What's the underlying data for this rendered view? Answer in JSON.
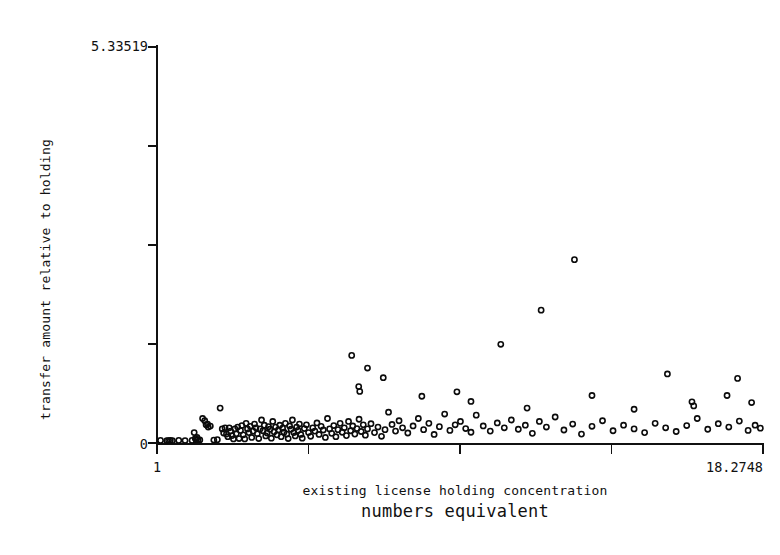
{
  "chart_data": {
    "type": "scatter",
    "title": "",
    "xlabel": "existing license holding concentration",
    "xlabel_line2": "numbers equivalent",
    "ylabel": "transfer amount relative to holding",
    "xlim": [
      1,
      18.2748
    ],
    "ylim": [
      0,
      5.33519
    ],
    "xticks": [
      1,
      5.3187,
      9.6374,
      13.9561,
      18.2748
    ],
    "xtick_labels": [
      "1",
      "",
      "",
      "",
      "18.2748"
    ],
    "yticks": [
      0,
      1.333798,
      2.667595,
      4.001393,
      5.33519
    ],
    "ytick_labels": [
      "0",
      "",
      "",
      "",
      "5.33519"
    ],
    "grid": false,
    "legend": null,
    "marker": "open-circle",
    "marker_color": "#0b0b0b",
    "n_points": 174,
    "points": [
      [
        1.1,
        0.035
      ],
      [
        1.28,
        0.03
      ],
      [
        1.33,
        0.032
      ],
      [
        1.38,
        0.035
      ],
      [
        1.44,
        0.03
      ],
      [
        1.62,
        0.035
      ],
      [
        1.8,
        0.033
      ],
      [
        2.0,
        0.035
      ],
      [
        2.06,
        0.14
      ],
      [
        2.09,
        0.06
      ],
      [
        2.12,
        0.04
      ],
      [
        2.14,
        0.075
      ],
      [
        2.17,
        0.045
      ],
      [
        2.22,
        0.042
      ],
      [
        2.3,
        0.33
      ],
      [
        2.36,
        0.3
      ],
      [
        2.4,
        0.245
      ],
      [
        2.44,
        0.255
      ],
      [
        2.46,
        0.215
      ],
      [
        2.52,
        0.228
      ],
      [
        2.62,
        0.04
      ],
      [
        2.72,
        0.045
      ],
      [
        2.8,
        0.47
      ],
      [
        2.86,
        0.19
      ],
      [
        2.9,
        0.135
      ],
      [
        2.94,
        0.205
      ],
      [
        2.98,
        0.12
      ],
      [
        3.02,
        0.085
      ],
      [
        3.06,
        0.205
      ],
      [
        3.1,
        0.16
      ],
      [
        3.14,
        0.1
      ],
      [
        3.18,
        0.055
      ],
      [
        3.22,
        0.19
      ],
      [
        3.26,
        0.125
      ],
      [
        3.3,
        0.215
      ],
      [
        3.34,
        0.06
      ],
      [
        3.38,
        0.17
      ],
      [
        3.42,
        0.235
      ],
      [
        3.46,
        0.11
      ],
      [
        3.5,
        0.055
      ],
      [
        3.54,
        0.265
      ],
      [
        3.58,
        0.19
      ],
      [
        3.62,
        0.14
      ],
      [
        3.66,
        0.225
      ],
      [
        3.7,
        0.075
      ],
      [
        3.74,
        0.16
      ],
      [
        3.78,
        0.255
      ],
      [
        3.82,
        0.205
      ],
      [
        3.86,
        0.125
      ],
      [
        3.9,
        0.06
      ],
      [
        3.94,
        0.19
      ],
      [
        3.98,
        0.31
      ],
      [
        4.02,
        0.165
      ],
      [
        4.06,
        0.24
      ],
      [
        4.1,
        0.095
      ],
      [
        4.14,
        0.135
      ],
      [
        4.18,
        0.22
      ],
      [
        4.22,
        0.185
      ],
      [
        4.26,
        0.065
      ],
      [
        4.3,
        0.29
      ],
      [
        4.34,
        0.15
      ],
      [
        4.38,
        0.215
      ],
      [
        4.42,
        0.11
      ],
      [
        4.46,
        0.175
      ],
      [
        4.5,
        0.24
      ],
      [
        4.54,
        0.085
      ],
      [
        4.58,
        0.2
      ],
      [
        4.62,
        0.145
      ],
      [
        4.66,
        0.265
      ],
      [
        4.7,
        0.12
      ],
      [
        4.74,
        0.06
      ],
      [
        4.78,
        0.23
      ],
      [
        4.82,
        0.185
      ],
      [
        4.86,
        0.31
      ],
      [
        4.9,
        0.14
      ],
      [
        4.94,
        0.095
      ],
      [
        4.98,
        0.215
      ],
      [
        5.02,
        0.17
      ],
      [
        5.06,
        0.255
      ],
      [
        5.1,
        0.115
      ],
      [
        5.14,
        0.065
      ],
      [
        5.2,
        0.195
      ],
      [
        5.26,
        0.245
      ],
      [
        5.32,
        0.14
      ],
      [
        5.38,
        0.09
      ],
      [
        5.44,
        0.205
      ],
      [
        5.5,
        0.16
      ],
      [
        5.56,
        0.27
      ],
      [
        5.62,
        0.115
      ],
      [
        5.68,
        0.225
      ],
      [
        5.74,
        0.175
      ],
      [
        5.8,
        0.075
      ],
      [
        5.86,
        0.33
      ],
      [
        5.92,
        0.19
      ],
      [
        5.98,
        0.13
      ],
      [
        6.04,
        0.235
      ],
      [
        6.1,
        0.085
      ],
      [
        6.16,
        0.18
      ],
      [
        6.22,
        0.265
      ],
      [
        6.28,
        0.145
      ],
      [
        6.34,
        0.205
      ],
      [
        6.4,
        0.1
      ],
      [
        6.46,
        0.29
      ],
      [
        6.52,
        0.165
      ],
      [
        6.58,
        0.23
      ],
      [
        6.64,
        0.12
      ],
      [
        6.7,
        0.195
      ],
      [
        6.76,
        0.32
      ],
      [
        6.82,
        0.155
      ],
      [
        6.88,
        0.245
      ],
      [
        6.94,
        0.105
      ],
      [
        7.0,
        0.19
      ],
      [
        7.1,
        0.26
      ],
      [
        7.2,
        0.14
      ],
      [
        7.3,
        0.215
      ],
      [
        7.4,
        0.09
      ],
      [
        7.5,
        0.18
      ],
      [
        7.6,
        0.415
      ],
      [
        7.7,
        0.25
      ],
      [
        7.8,
        0.16
      ],
      [
        7.9,
        0.3
      ],
      [
        8.0,
        0.205
      ],
      [
        8.15,
        0.135
      ],
      [
        8.3,
        0.23
      ],
      [
        8.45,
        0.33
      ],
      [
        8.6,
        0.18
      ],
      [
        8.75,
        0.265
      ],
      [
        8.9,
        0.115
      ],
      [
        9.05,
        0.22
      ],
      [
        9.2,
        0.39
      ],
      [
        9.35,
        0.17
      ],
      [
        9.5,
        0.245
      ],
      [
        9.65,
        0.29
      ],
      [
        9.8,
        0.195
      ],
      [
        9.95,
        0.145
      ],
      [
        10.1,
        0.375
      ],
      [
        10.3,
        0.23
      ],
      [
        10.5,
        0.16
      ],
      [
        10.7,
        0.27
      ],
      [
        10.9,
        0.205
      ],
      [
        11.1,
        0.31
      ],
      [
        11.3,
        0.185
      ],
      [
        11.5,
        0.24
      ],
      [
        11.7,
        0.13
      ],
      [
        11.9,
        0.29
      ],
      [
        12.1,
        0.215
      ],
      [
        12.35,
        0.35
      ],
      [
        12.6,
        0.175
      ],
      [
        12.85,
        0.255
      ],
      [
        13.1,
        0.12
      ],
      [
        13.4,
        0.225
      ],
      [
        13.7,
        0.3
      ],
      [
        14.0,
        0.165
      ],
      [
        14.3,
        0.24
      ],
      [
        14.6,
        0.19
      ],
      [
        14.9,
        0.14
      ],
      [
        15.2,
        0.265
      ],
      [
        15.5,
        0.205
      ],
      [
        15.8,
        0.155
      ],
      [
        16.1,
        0.235
      ],
      [
        16.4,
        0.33
      ],
      [
        16.7,
        0.185
      ],
      [
        17.0,
        0.26
      ],
      [
        17.3,
        0.215
      ],
      [
        17.6,
        0.295
      ],
      [
        17.85,
        0.17
      ],
      [
        18.05,
        0.24
      ],
      [
        18.2,
        0.2
      ],
      [
        6.55,
        1.18
      ],
      [
        7.0,
        1.01
      ],
      [
        7.45,
        0.88
      ],
      [
        6.75,
        0.76
      ],
      [
        6.78,
        0.695
      ],
      [
        9.55,
        0.69
      ],
      [
        10.8,
        1.33
      ],
      [
        11.95,
        1.79
      ],
      [
        12.9,
        2.47
      ],
      [
        13.4,
        0.64
      ],
      [
        15.55,
        0.93
      ],
      [
        17.55,
        0.87
      ],
      [
        17.25,
        0.64
      ],
      [
        17.95,
        0.545
      ],
      [
        16.25,
        0.555
      ],
      [
        16.3,
        0.5
      ],
      [
        8.55,
        0.63
      ],
      [
        9.95,
        0.56
      ],
      [
        11.55,
        0.47
      ],
      [
        14.6,
        0.455
      ]
    ]
  },
  "figure": {
    "background_color": "#ffffff",
    "axis_color": "#111111",
    "marker_color": "#0b0b0b",
    "x_axis_name": "x-axis",
    "y_axis_name": "y-axis"
  }
}
